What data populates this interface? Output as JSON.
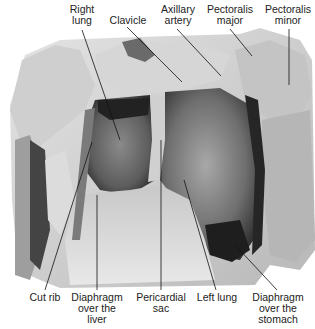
{
  "figure": {
    "colors": {
      "background": "#ffffff",
      "label_text": "#222222",
      "leader_line": "#111111",
      "tissue_light": "#d8d8d8",
      "tissue_mid": "#9a9a9a",
      "tissue_dark": "#3a3a3a"
    },
    "labels_top": [
      {
        "id": "right-lung",
        "line1": "Right",
        "line2": "lung"
      },
      {
        "id": "clavicle",
        "line1": "Clavicle",
        "line2": ""
      },
      {
        "id": "axillary-artery",
        "line1": "Axillary",
        "line2": "artery"
      },
      {
        "id": "pectoralis-major",
        "line1": "Pectoralis",
        "line2": "major"
      },
      {
        "id": "pectoralis-minor",
        "line1": "Pectoralis",
        "line2": "minor"
      }
    ],
    "labels_bottom": [
      {
        "id": "cut-rib",
        "line1": "Cut rib",
        "line2": "",
        "line3": ""
      },
      {
        "id": "diaphragm-liver",
        "line1": "Diaphragm",
        "line2": "over the",
        "line3": "liver"
      },
      {
        "id": "pericardial-sac",
        "line1": "Pericardial",
        "line2": "sac",
        "line3": ""
      },
      {
        "id": "left-lung",
        "line1": "Left lung",
        "line2": "",
        "line3": ""
      },
      {
        "id": "diaphragm-stomach",
        "line1": "Diaphragm",
        "line2": "over the",
        "line3": "stomach"
      }
    ]
  }
}
